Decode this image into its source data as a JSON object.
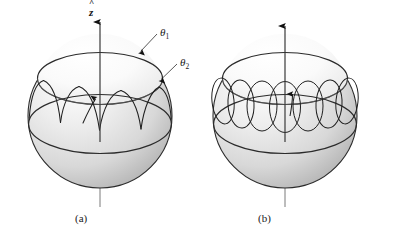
{
  "figure": {
    "axis_label": "z",
    "axis_hat": "^",
    "angle_labels": [
      {
        "id": "theta1",
        "base": "θ",
        "sub": "1"
      },
      {
        "id": "theta2",
        "base": "θ",
        "sub": "2"
      }
    ],
    "panels": [
      {
        "id": "a",
        "caption": "(a)",
        "path_type": "cusped-precession"
      },
      {
        "id": "b",
        "caption": "(b)",
        "path_type": "looping-precession"
      }
    ],
    "colors": {
      "line": "#1a1a1a",
      "sphere_light": "#ffffff",
      "sphere_mid": "#e3e3e3",
      "sphere_dark": "#b9b9b9",
      "cap_light": "#fdfdfd",
      "background": "#ffffff"
    }
  }
}
